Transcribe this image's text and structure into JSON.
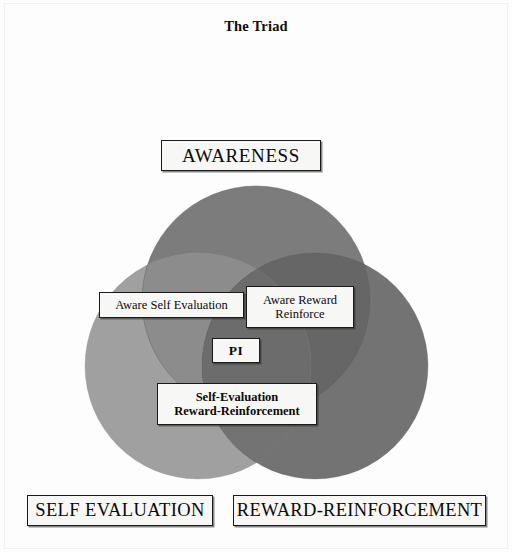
{
  "diagram": {
    "title": "The Triad",
    "type": "venn-3-set",
    "background_color": "#fdfdfd",
    "sets": [
      {
        "id": "awareness",
        "label": "AWARENESS",
        "position": "top",
        "fill_color": "#7c7c7c",
        "cx": 256,
        "cy": 300,
        "r": 114
      },
      {
        "id": "self-evaluation",
        "label": "SELF EVALUATION",
        "position": "bottom-left",
        "fill_color": "#a0a0a0",
        "cx": 198,
        "cy": 366,
        "r": 113
      },
      {
        "id": "reward-reinforcement",
        "label": "REWARD-REINFORCEMENT",
        "position": "bottom-right",
        "fill_color": "#737373",
        "cx": 315,
        "cy": 366,
        "r": 113
      }
    ],
    "intersections": [
      {
        "id": "aware-self-evaluation",
        "label": "Aware Self Evaluation",
        "sets": [
          "awareness",
          "self-evaluation"
        ]
      },
      {
        "id": "aware-reward-reinforce",
        "label": "Aware Reward\nReinforce",
        "sets": [
          "awareness",
          "reward-reinforcement"
        ]
      },
      {
        "id": "self-evaluation-reward-reinforcement",
        "label": "Self-Evaluation\nReward-Reinforcement",
        "sets": [
          "self-evaluation",
          "reward-reinforcement"
        ]
      },
      {
        "id": "pi",
        "label": "PI",
        "sets": [
          "awareness",
          "self-evaluation",
          "reward-reinforcement"
        ]
      }
    ],
    "colors": {
      "top_circle": "#7c7c7c",
      "left_circle": "#a0a0a0",
      "right_circle": "#737373",
      "overlap_top_left": "#8a8a8a",
      "overlap_top_right": "#666666",
      "overlap_left_right": "#717171",
      "overlap_center": "#6b6b6b",
      "label_border": "#1a1a1a",
      "label_fill": "#f7f7f5",
      "text": "#0a0a0a"
    }
  }
}
